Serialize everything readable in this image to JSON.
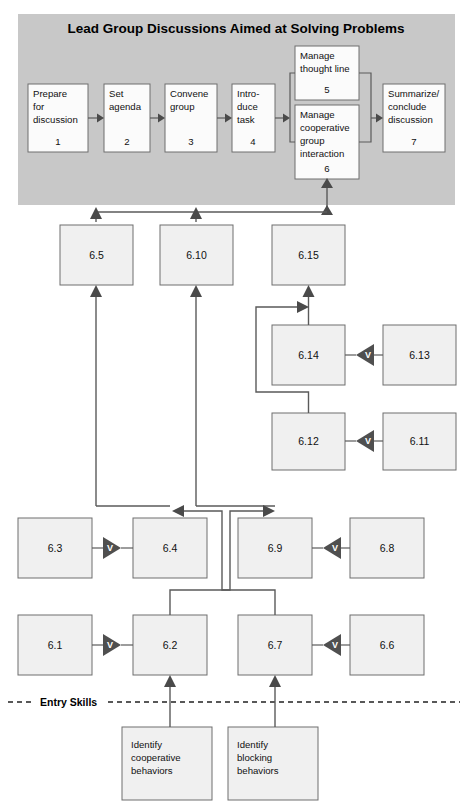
{
  "diagram": {
    "title": "Lead Group Discussions Aimed at Solving Problems",
    "entry_skills_label": "Entry Skills",
    "colors": {
      "band": "#c8c8c8",
      "node_fill": "#f0f0f0",
      "node_fill_white": "#fbfbfb",
      "node_stroke": "#6e6e6e",
      "connector": "#5a5a5a",
      "gate": "#4f4f4f",
      "gate_text": "#ffffff",
      "text": "#111111"
    },
    "gate_label": "V",
    "top_steps": [
      {
        "id": "step-1",
        "lines": [
          "Prepare",
          "for",
          "discussion"
        ],
        "number": "1"
      },
      {
        "id": "step-2",
        "lines": [
          "Set",
          "agenda"
        ],
        "number": "2"
      },
      {
        "id": "step-3",
        "lines": [
          "Convene",
          "group"
        ],
        "number": "3"
      },
      {
        "id": "step-4",
        "lines": [
          "Intro-",
          "duce",
          "task"
        ],
        "number": "4"
      },
      {
        "id": "step-5",
        "lines": [
          "Manage",
          "thought line"
        ],
        "number": "5"
      },
      {
        "id": "step-6",
        "lines": [
          "Manage",
          "cooperative",
          "group",
          "interaction"
        ],
        "number": "6"
      },
      {
        "id": "step-7",
        "lines": [
          "Summarize/",
          "conclude",
          "discussion"
        ],
        "number": "7"
      }
    ],
    "subskills": [
      {
        "id": "node-6-5",
        "label": "6.5"
      },
      {
        "id": "node-6-10",
        "label": "6.10"
      },
      {
        "id": "node-6-15",
        "label": "6.15"
      },
      {
        "id": "node-6-14",
        "label": "6.14"
      },
      {
        "id": "node-6-13",
        "label": "6.13"
      },
      {
        "id": "node-6-12",
        "label": "6.12"
      },
      {
        "id": "node-6-11",
        "label": "6.11"
      },
      {
        "id": "node-6-3",
        "label": "6.3"
      },
      {
        "id": "node-6-4",
        "label": "6.4"
      },
      {
        "id": "node-6-9",
        "label": "6.9"
      },
      {
        "id": "node-6-8",
        "label": "6.8"
      },
      {
        "id": "node-6-1",
        "label": "6.1"
      },
      {
        "id": "node-6-2",
        "label": "6.2"
      },
      {
        "id": "node-6-7",
        "label": "6.7"
      },
      {
        "id": "node-6-6",
        "label": "6.6"
      }
    ],
    "entry_skill_boxes": [
      {
        "id": "entry-cooperative",
        "lines": [
          "Identify",
          "cooperative",
          "behaviors"
        ]
      },
      {
        "id": "entry-blocking",
        "lines": [
          "Identify",
          "blocking",
          "behaviors"
        ]
      }
    ]
  }
}
